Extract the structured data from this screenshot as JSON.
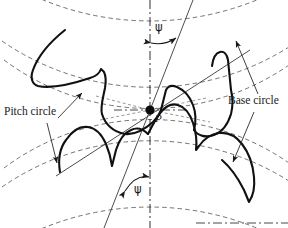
{
  "figure": {
    "background_color": "#ffffff",
    "line_color": "#1a1a1a",
    "dashed_color": "#555555",
    "width": 288,
    "height": 228
  },
  "labels": {
    "pitch_circle": "Pitch circle",
    "base_circle": "Base circle",
    "pitch_point": "P",
    "helix_angle_top": "ψ",
    "helix_angle_bottom": "ψ"
  },
  "annotations": {
    "pitch_point_description": "Pitch point where the two pitch circles are tangent",
    "centerline_description": "Vertical dash-dot centre line through the pitch point",
    "line_of_action_count": 2,
    "helix_angle_symbol": "ψ"
  },
  "geometry": {
    "pitch_point": {
      "x": 150,
      "y": 110
    },
    "upper_gear_center": {
      "x": 150,
      "y": -150
    },
    "lower_gear_center": {
      "x": 150,
      "y": 372
    },
    "pitch_radius": 260,
    "base_radius": 244,
    "addendum_radius": 282,
    "helix_angle_degrees": 24
  }
}
